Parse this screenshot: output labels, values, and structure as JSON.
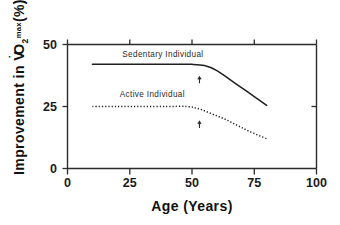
{
  "chart_data": {
    "type": "line",
    "title": "",
    "xlabel": "Age (Years)",
    "ylabel": "Improvement in V̇O2max(%)",
    "ylabel_parts": {
      "lead": "Improvement in V",
      "dot": "˙",
      "o": "O",
      "sub": "2",
      "sup": "max",
      "tail": "(%)"
    },
    "xlim": [
      0,
      100
    ],
    "ylim": [
      0,
      50
    ],
    "xticks": [
      0,
      25,
      50,
      75,
      100
    ],
    "xtick_labels": [
      "0",
      "25",
      "50",
      "75",
      "100"
    ],
    "yticks": [
      0,
      25,
      50
    ],
    "ytick_labels": [
      "0",
      "25",
      "50"
    ],
    "grid": false,
    "legend_position": "inline-annotation",
    "series": [
      {
        "name": "Sedentary Individual",
        "style": "solid",
        "color": "#1f1f1f",
        "label_x": 22,
        "label_y": 45,
        "x": [
          10,
          20,
          30,
          40,
          50,
          55,
          60,
          65,
          70,
          75,
          80
        ],
        "values": [
          42,
          42,
          42,
          42,
          42,
          41.5,
          39.5,
          36,
          32.5,
          29,
          25.5
        ]
      },
      {
        "name": "Active Individual",
        "style": "dotted",
        "color": "#1f1f1f",
        "label_x": 21,
        "label_y": 29,
        "x": [
          10,
          20,
          30,
          40,
          48,
          53,
          58,
          63,
          68,
          73,
          80
        ],
        "values": [
          25,
          25,
          25,
          25,
          25,
          24,
          22,
          20,
          17.5,
          15,
          12
        ]
      }
    ],
    "annotations": [
      {
        "name": "sedentary-arrow",
        "type": "arrow-up",
        "x": 53,
        "y": 37.0,
        "length": 6.5
      },
      {
        "name": "active-arrow",
        "type": "arrow-up",
        "x": 53,
        "y": 19.0,
        "length": 6.5
      }
    ]
  }
}
